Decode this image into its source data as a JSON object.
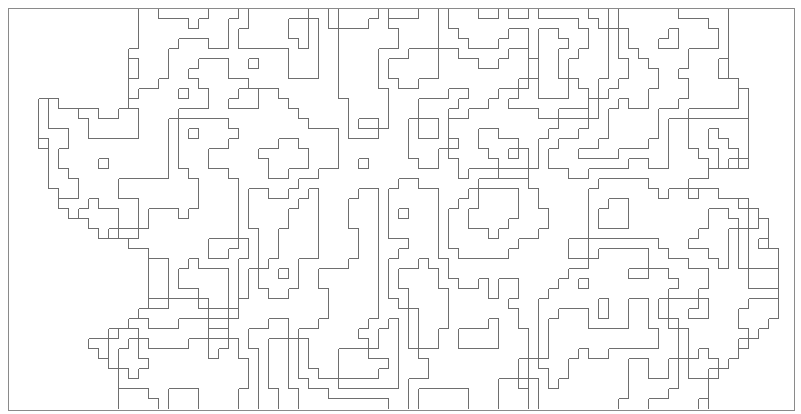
{
  "figure": {
    "kind": "grid-aligned contour line drawing",
    "width": 801,
    "height": 414,
    "background": "#ffffff",
    "frame": {
      "x": 8,
      "y": 8,
      "w": 786,
      "h": 402,
      "stroke": "#8a8a8a",
      "stroke_width": 1
    },
    "grid": {
      "origin_x": 8,
      "origin_y": 8,
      "cell": 10,
      "cols": 79,
      "rows": 40
    },
    "line_color": "#6e6e6e",
    "line_width": 1,
    "levels": [
      0.18,
      0.32,
      0.46,
      0.6,
      0.74
    ],
    "seed": 7,
    "silhouette": [
      [
        13,
        0
      ],
      [
        43,
        0
      ],
      [
        53,
        0
      ],
      [
        62,
        0
      ],
      [
        72,
        0
      ],
      [
        72,
        6
      ],
      [
        74,
        9
      ],
      [
        74,
        16
      ],
      [
        67,
        17
      ],
      [
        73,
        19
      ],
      [
        75,
        20
      ],
      [
        76,
        22
      ],
      [
        77,
        25
      ],
      [
        77,
        30
      ],
      [
        75,
        33
      ],
      [
        72,
        36
      ],
      [
        70,
        38
      ],
      [
        70,
        40
      ],
      [
        11,
        40
      ],
      [
        11,
        37
      ],
      [
        9,
        34
      ],
      [
        8,
        33
      ],
      [
        12,
        32
      ],
      [
        14,
        30
      ],
      [
        14,
        24
      ],
      [
        10,
        23
      ],
      [
        7,
        21
      ],
      [
        5,
        19
      ],
      [
        4,
        16
      ],
      [
        3,
        12
      ],
      [
        3,
        9
      ],
      [
        4,
        9
      ],
      [
        6,
        10
      ],
      [
        8,
        10
      ],
      [
        10,
        11
      ],
      [
        12,
        10
      ],
      [
        12,
        6
      ],
      [
        13,
        3
      ]
    ]
  }
}
